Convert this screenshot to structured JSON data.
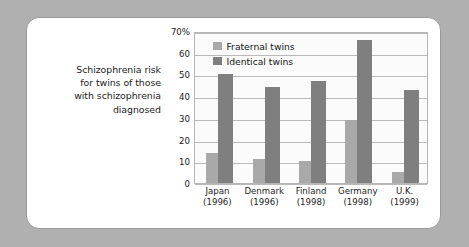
{
  "caption": {
    "lines": [
      "Schizophrenia risk",
      "for twins of those",
      "with schizophrenia",
      "diagnosed"
    ]
  },
  "colors": {
    "fraternal": "#a9a9a9",
    "identical": "#7f7f7f",
    "plot_background": "#fbfbfb",
    "gridline": "#b9b9b9",
    "card_background": "#ffffff",
    "card_border": "#9a9a9a",
    "mat_background": "#b0b0b0",
    "text": "#1c1c1c"
  },
  "chart_data": {
    "type": "bar",
    "title": "",
    "subtitle": "",
    "xlabel": "",
    "ylabel": "",
    "ylim": [
      0,
      70
    ],
    "yticks": [
      0,
      10,
      20,
      30,
      40,
      50,
      60,
      70
    ],
    "ytick_labels": [
      "0",
      "10",
      "20",
      "30",
      "40",
      "50",
      "60",
      "70%"
    ],
    "grid": true,
    "legend_position": "top-left-inside",
    "categories": [
      "Japan\n(1996)",
      "Denmark\n(1996)",
      "Finland\n(1998)",
      "Germany\n(1998)",
      "U.K.\n(1999)"
    ],
    "category_names": [
      "Japan",
      "Denmark",
      "Finland",
      "Germany",
      "U.K."
    ],
    "category_years": [
      "(1996)",
      "(1996)",
      "(1998)",
      "(1998)",
      "(1999)"
    ],
    "series": [
      {
        "name": "Fraternal twins",
        "color": "#a9a9a9",
        "values": [
          14,
          11,
          10,
          29,
          5
        ]
      },
      {
        "name": "Identical twins",
        "color": "#7f7f7f",
        "values": [
          50,
          44,
          47,
          66,
          43
        ]
      }
    ]
  }
}
